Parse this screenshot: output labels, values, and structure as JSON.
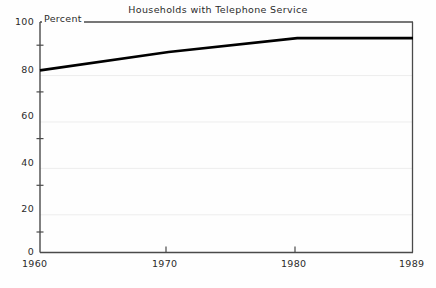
{
  "chart_data": {
    "type": "line",
    "title": "Households with Telephone Service",
    "ylabel": "Percent",
    "xlabel": "",
    "x": [
      1960,
      1970,
      1980,
      1989
    ],
    "values": [
      79,
      87,
      93,
      93
    ],
    "series": [
      {
        "name": "Households with Telephone Service",
        "values": [
          79,
          87,
          93,
          93
        ]
      }
    ],
    "xticks": [
      1960,
      1970,
      1980,
      1989
    ],
    "xtick_labels": [
      "1960",
      "1970",
      "1980",
      "1989"
    ],
    "yticks": [
      0,
      20,
      40,
      60,
      80,
      100
    ],
    "ytick_labels": [
      "0",
      "20",
      "40",
      "60",
      "80",
      "100"
    ],
    "yminor_ticks": [
      10,
      30,
      50,
      70,
      90
    ],
    "xlim": [
      1960,
      1989
    ],
    "ylim": [
      0,
      100
    ],
    "grid": true,
    "grid_color": "#eeeeee",
    "legend": "none",
    "line_color": "#000000",
    "axis_color": "#555555",
    "background_color": "#fefefe"
  },
  "axis": {
    "y_labels": [
      "100",
      "80",
      "60",
      "40",
      "20",
      "0"
    ],
    "x_labels": [
      "1960",
      "1970",
      "1980",
      "1989"
    ],
    "unit_label": "Percent"
  }
}
